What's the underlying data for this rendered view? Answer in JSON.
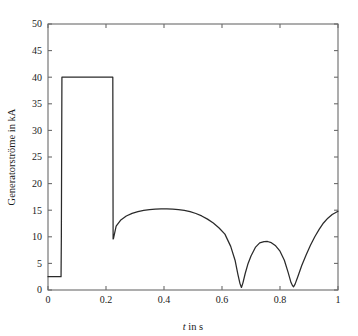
{
  "chart_data": {
    "type": "line",
    "title": "",
    "subtitle": "",
    "xlabel": "t in s",
    "xlabel_italic_part": "t",
    "xlabel_rest_part": " in s",
    "ylabel": "Generatorströme in kA",
    "xlim": [
      0,
      1
    ],
    "ylim": [
      0,
      50
    ],
    "xticks": [
      0,
      0.2,
      0.4,
      0.6,
      0.8,
      1
    ],
    "xtick_labels": [
      "0",
      "0.2",
      "0.4",
      "0.6",
      "0.8",
      "1"
    ],
    "yticks": [
      0,
      5,
      10,
      15,
      20,
      25,
      30,
      35,
      40,
      45,
      50
    ],
    "ytick_labels": [
      "0",
      "5",
      "10",
      "15",
      "20",
      "25",
      "30",
      "35",
      "40",
      "45",
      "50"
    ],
    "grid": false,
    "legend": null,
    "legend_position": "none",
    "line_color": "#2a2a2a",
    "axis_color": "#6b6b6b",
    "background_color": "#ffffff",
    "annotations": [],
    "series": [
      {
        "name": "Generatorströme",
        "description": "Envelope of generator currents: pre-fault level, rectangular short-circuit pulse band, then decaying oscillatory envelope with two near-zero minima",
        "x": [
          0.0,
          0.01,
          0.02,
          0.03,
          0.042,
          0.045,
          0.046,
          0.048,
          0.05,
          0.08,
          0.12,
          0.16,
          0.2,
          0.222,
          0.2235,
          0.2245,
          0.2255,
          0.235,
          0.25,
          0.27,
          0.29,
          0.31,
          0.33,
          0.35,
          0.37,
          0.39,
          0.41,
          0.43,
          0.45,
          0.47,
          0.49,
          0.51,
          0.53,
          0.55,
          0.57,
          0.59,
          0.61,
          0.63,
          0.645,
          0.655,
          0.662,
          0.667,
          0.672,
          0.68,
          0.69,
          0.7,
          0.715,
          0.73,
          0.745,
          0.757,
          0.77,
          0.785,
          0.8,
          0.815,
          0.828,
          0.838,
          0.843,
          0.847,
          0.852,
          0.862,
          0.875,
          0.89,
          0.905,
          0.92,
          0.935,
          0.95,
          0.965,
          0.98,
          1.0
        ],
        "y": [
          2.5,
          2.5,
          2.5,
          2.5,
          2.5,
          2.5,
          9.6,
          40.0,
          40.0,
          40.0,
          40.0,
          40.0,
          40.0,
          40.0,
          40.0,
          9.6,
          9.6,
          12.0,
          13.1,
          13.9,
          14.4,
          14.75,
          14.98,
          15.12,
          15.2,
          15.24,
          15.25,
          15.21,
          15.12,
          14.96,
          14.72,
          14.38,
          13.92,
          13.32,
          12.58,
          11.66,
          10.5,
          8.2,
          5.6,
          2.9,
          1.2,
          0.48,
          1.3,
          3.1,
          5.0,
          6.4,
          8.0,
          8.85,
          9.1,
          9.12,
          8.9,
          8.3,
          7.3,
          5.6,
          3.3,
          1.4,
          0.85,
          0.6,
          1.1,
          2.6,
          4.6,
          6.6,
          8.4,
          10.0,
          11.4,
          12.6,
          13.5,
          14.2,
          14.8
        ]
      }
    ],
    "features": {
      "pre_fault_level_kA": 2.5,
      "pre_fault_end_s": 0.045,
      "pulse_top_kA": 40.0,
      "pulse_bottom_kA": 9.6,
      "pulse_start_s": 0.048,
      "pulse_end_s": 0.2245,
      "post_pulse_level_kA": 12.0,
      "broad_peak_kA": 15.25,
      "broad_peak_s": 0.41,
      "first_minimum_kA": 0.48,
      "first_minimum_s": 0.667,
      "middle_peak_kA": 9.12,
      "middle_peak_s": 0.757,
      "second_minimum_kA": 0.6,
      "second_minimum_s": 0.847,
      "final_value_kA": 14.8,
      "final_value_s": 1.0
    }
  }
}
